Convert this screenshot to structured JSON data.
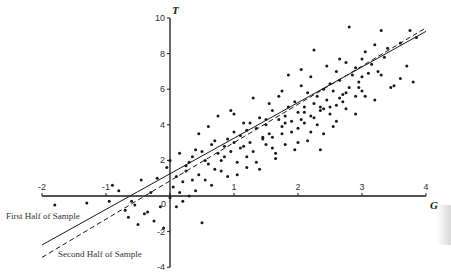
{
  "chart_data": {
    "type": "scatter",
    "title": "",
    "xlabel": "G",
    "ylabel": "T",
    "xlim": [
      -2,
      4
    ],
    "ylim": [
      -4,
      10
    ],
    "x_ticks": [
      -2,
      -1,
      0,
      1,
      2,
      3,
      4
    ],
    "y_ticks": [
      -4,
      -2,
      0,
      2,
      4,
      6,
      8,
      10
    ],
    "x_tick_labels": [
      "-2",
      "-1",
      "0",
      "1",
      "2",
      "3",
      "4"
    ],
    "y_tick_labels": [
      "-4",
      "-2",
      "0",
      "2",
      "4",
      "6",
      "8",
      "10"
    ],
    "grid": false,
    "axes_cross_at_origin": true,
    "series": [
      {
        "name": "Observations",
        "kind": "scatter",
        "points": [
          [
            -1.8,
            -0.5
          ],
          [
            -1.3,
            -0.4
          ],
          [
            -0.8,
            0.3
          ],
          [
            -0.7,
            -0.8
          ],
          [
            -0.65,
            -1.2
          ],
          [
            -0.6,
            -0.3
          ],
          [
            -0.55,
            -0.5
          ],
          [
            -0.5,
            -1.6
          ],
          [
            -0.45,
            0.9
          ],
          [
            -0.4,
            -1.0
          ],
          [
            -0.3,
            0.2
          ],
          [
            -0.25,
            -1.4
          ],
          [
            -0.2,
            1.0
          ],
          [
            -0.15,
            -0.6
          ],
          [
            -0.1,
            -1.8
          ],
          [
            -0.05,
            1.6
          ],
          [
            0.0,
            2.0
          ],
          [
            0.0,
            -0.1
          ],
          [
            0.05,
            0.5
          ],
          [
            0.1,
            -0.6
          ],
          [
            0.1,
            1.1
          ],
          [
            0.15,
            0.2
          ],
          [
            0.2,
            0.8
          ],
          [
            0.25,
            1.4
          ],
          [
            0.3,
            1.9
          ],
          [
            0.3,
            0.0
          ],
          [
            0.35,
            2.2
          ],
          [
            0.4,
            0.3
          ],
          [
            0.45,
            1.2
          ],
          [
            0.5,
            2.5
          ],
          [
            0.5,
            -1.5
          ],
          [
            0.55,
            0.9
          ],
          [
            0.6,
            1.8
          ],
          [
            0.6,
            3.9
          ],
          [
            0.65,
            2.9
          ],
          [
            0.7,
            1.5
          ],
          [
            0.75,
            2.4
          ],
          [
            0.8,
            2.0
          ],
          [
            0.85,
            2.8
          ],
          [
            0.9,
            3.2
          ],
          [
            0.9,
            1.1
          ],
          [
            0.95,
            2.5
          ],
          [
            1.0,
            3.0
          ],
          [
            1.0,
            4.6
          ],
          [
            1.05,
            1.9
          ],
          [
            1.1,
            3.4
          ],
          [
            1.1,
            2.7
          ],
          [
            1.15,
            4.1
          ],
          [
            1.2,
            2.2
          ],
          [
            1.2,
            3.7
          ],
          [
            1.25,
            3.0
          ],
          [
            1.3,
            5.5
          ],
          [
            1.3,
            2.5
          ],
          [
            1.35,
            3.8
          ],
          [
            1.4,
            4.4
          ],
          [
            1.4,
            1.5
          ],
          [
            1.45,
            3.2
          ],
          [
            1.5,
            4.0
          ],
          [
            1.5,
            2.9
          ],
          [
            1.55,
            3.5
          ],
          [
            1.6,
            4.8
          ],
          [
            1.6,
            3.3
          ],
          [
            1.65,
            2.4
          ],
          [
            1.7,
            4.3
          ],
          [
            1.7,
            5.6
          ],
          [
            1.75,
            3.9
          ],
          [
            1.8,
            4.5
          ],
          [
            1.8,
            2.9
          ],
          [
            1.85,
            5.0
          ],
          [
            1.9,
            4.2
          ],
          [
            1.9,
            3.6
          ],
          [
            1.95,
            5.3
          ],
          [
            2.0,
            4.7
          ],
          [
            2.0,
            3.8
          ],
          [
            2.05,
            6.2
          ],
          [
            2.1,
            5.0
          ],
          [
            2.1,
            4.1
          ],
          [
            2.15,
            5.8
          ],
          [
            2.2,
            4.5
          ],
          [
            2.2,
            6.7
          ],
          [
            2.25,
            5.2
          ],
          [
            2.3,
            4.0
          ],
          [
            2.3,
            5.6
          ],
          [
            2.35,
            4.8
          ],
          [
            2.4,
            6.0
          ],
          [
            2.4,
            3.5
          ],
          [
            2.45,
            5.4
          ],
          [
            2.5,
            6.3
          ],
          [
            2.5,
            4.6
          ],
          [
            2.55,
            5.9
          ],
          [
            2.6,
            7.0
          ],
          [
            2.6,
            5.1
          ],
          [
            2.65,
            6.5
          ],
          [
            2.7,
            5.7
          ],
          [
            2.75,
            7.5
          ],
          [
            2.8,
            6.1
          ],
          [
            2.8,
            9.5
          ],
          [
            2.85,
            6.8
          ],
          [
            2.9,
            5.6
          ],
          [
            2.9,
            7.2
          ],
          [
            2.95,
            6.4
          ],
          [
            3.0,
            7.7
          ],
          [
            3.0,
            5.9
          ],
          [
            3.05,
            8.1
          ],
          [
            3.1,
            6.9
          ],
          [
            3.15,
            7.4
          ],
          [
            3.2,
            8.5
          ],
          [
            3.25,
            7.0
          ],
          [
            3.3,
            9.3
          ],
          [
            3.35,
            7.8
          ],
          [
            3.4,
            8.3
          ],
          [
            3.5,
            6.2
          ],
          [
            3.6,
            8.6
          ],
          [
            3.7,
            7.3
          ],
          [
            3.75,
            9.3
          ],
          [
            3.8,
            6.4
          ],
          [
            3.85,
            8.9
          ],
          [
            0.45,
            3.5
          ],
          [
            0.75,
            4.5
          ],
          [
            0.95,
            4.8
          ],
          [
            1.55,
            5.2
          ],
          [
            1.75,
            5.9
          ],
          [
            1.85,
            6.8
          ],
          [
            2.05,
            7.1
          ],
          [
            2.25,
            8.2
          ],
          [
            2.45,
            7.3
          ],
          [
            2.65,
            7.7
          ],
          [
            1.05,
            1.2
          ],
          [
            1.35,
            1.9
          ],
          [
            1.65,
            2.1
          ],
          [
            1.95,
            2.6
          ],
          [
            2.15,
            3.1
          ],
          [
            2.35,
            2.6
          ],
          [
            2.55,
            3.9
          ],
          [
            2.75,
            4.9
          ],
          [
            3.05,
            5.6
          ],
          [
            3.45,
            6.1
          ],
          [
            0.25,
            1.7
          ],
          [
            0.55,
            2.0
          ],
          [
            0.85,
            2.2
          ],
          [
            1.15,
            2.8
          ],
          [
            1.45,
            3.3
          ],
          [
            1.75,
            3.5
          ],
          [
            2.05,
            4.3
          ],
          [
            2.35,
            5.0
          ],
          [
            2.65,
            5.5
          ],
          [
            2.95,
            6.1
          ],
          [
            0.15,
            2.4
          ],
          [
            0.4,
            2.6
          ],
          [
            0.7,
            3.1
          ],
          [
            1.0,
            3.6
          ],
          [
            1.25,
            4.1
          ],
          [
            1.5,
            4.3
          ],
          [
            1.8,
            4.1
          ],
          [
            2.1,
            4.7
          ],
          [
            2.4,
            4.9
          ],
          [
            2.7,
            5.3
          ],
          [
            -0.9,
            0.6
          ],
          [
            -0.95,
            -0.3
          ],
          [
            -0.35,
            -0.9
          ],
          [
            0.2,
            -0.3
          ],
          [
            0.35,
            0.9
          ],
          [
            0.65,
            0.6
          ],
          [
            0.8,
            1.4
          ],
          [
            1.2,
            1.6
          ],
          [
            1.6,
            2.7
          ],
          [
            2.0,
            3.0
          ],
          [
            2.2,
            3.6
          ],
          [
            2.6,
            4.2
          ],
          [
            2.9,
            4.6
          ],
          [
            3.2,
            5.4
          ],
          [
            3.6,
            6.6
          ],
          [
            3.3,
            6.8
          ],
          [
            3.0,
            6.7
          ],
          [
            2.75,
            5.8
          ],
          [
            2.5,
            5.0
          ],
          [
            2.25,
            4.4
          ]
        ]
      },
      {
        "name": "First Half of Sample",
        "kind": "line",
        "style": "solid",
        "intercept": 1.25,
        "slope": 2.0,
        "x_range": [
          -2,
          4
        ]
      },
      {
        "name": "Second Half of Sample",
        "kind": "line",
        "style": "dashed",
        "intercept": 0.85,
        "slope": 2.15,
        "x_range": [
          -2,
          4
        ]
      }
    ],
    "annotations": [
      {
        "text": "First Half of Sample",
        "near": "solid line, lower-left"
      },
      {
        "text": "Second Half of Sample",
        "near": "dashed line, lower-left"
      }
    ],
    "legend": "inline labels at lower-left"
  },
  "labels": {
    "x_axis_title": "G",
    "y_axis_title": "T",
    "first_half": "First Half of Sample",
    "second_half": "Second Half of Sample"
  },
  "colors": {
    "ink": "#1a1a1a",
    "background": "#ffffff"
  }
}
